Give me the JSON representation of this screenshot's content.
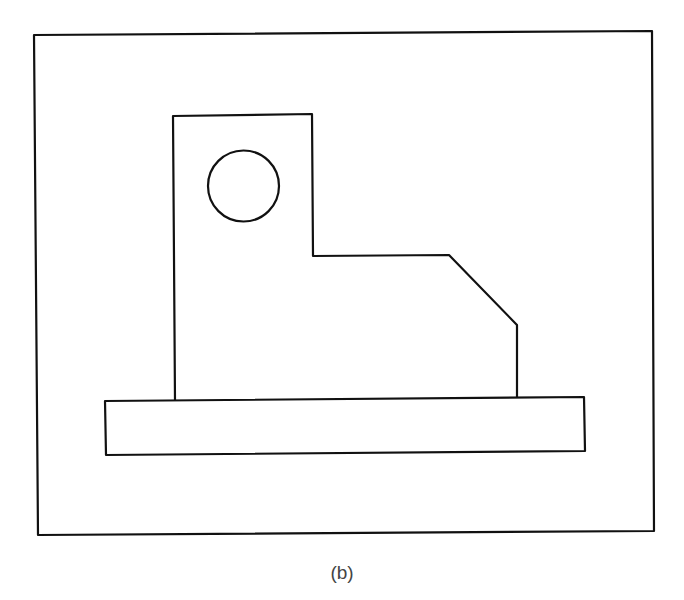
{
  "figure": {
    "caption": "(b)",
    "stroke_color": "#111111",
    "background": "#ffffff"
  },
  "shapes": {
    "outer_frame": {
      "points": "34,35 652,31 654,531 38,535"
    },
    "body_outline": {
      "points": "175,400 173,116 312,114 313,256 449,255 517,325 517,397"
    },
    "base_plate": {
      "points": "105,401 584,397 585,451 106,455"
    },
    "hole": {
      "cx": 243.5,
      "cy": 186,
      "r": 35.5
    }
  }
}
